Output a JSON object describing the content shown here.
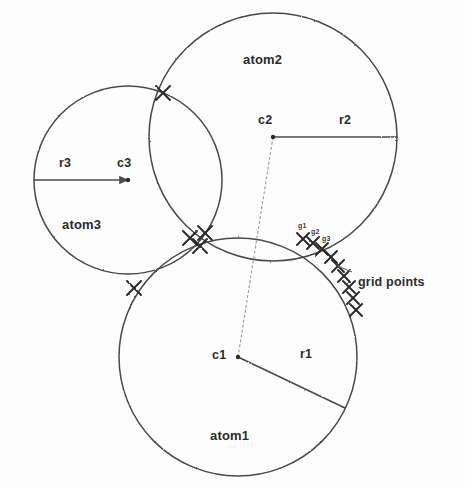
{
  "figure": {
    "background_color": "#fdfdfd",
    "stroke_color": "#4a4a4a",
    "mark_color": "#2b2b2b"
  },
  "atoms": [
    {
      "id": "atom1",
      "label": "atom1",
      "label_x": 210,
      "label_y": 428,
      "center_label": "c1",
      "center_label_x": 212,
      "center_label_y": 348,
      "radius_label": "r1",
      "radius_label_x": 300,
      "radius_label_y": 347,
      "cx": 238,
      "cy": 357,
      "r": 119,
      "radius_line": {
        "x1": 238,
        "y1": 357,
        "x2": 345,
        "y2": 408
      }
    },
    {
      "id": "atom2",
      "label": "atom2",
      "label_x": 243,
      "label_y": 52,
      "center_label": "c2",
      "center_label_x": 258,
      "center_label_y": 113,
      "radius_label": "r2",
      "radius_label_x": 339,
      "radius_label_y": 113,
      "cx": 273,
      "cy": 137,
      "r": 124,
      "radius_line": {
        "x1": 273,
        "y1": 137,
        "x2": 397,
        "y2": 137
      }
    },
    {
      "id": "atom3",
      "label": "atom3",
      "label_x": 62,
      "label_y": 217,
      "center_label": "c3",
      "center_label_x": 117,
      "center_label_y": 156,
      "radius_label": "r3",
      "radius_label_x": 59,
      "radius_label_y": 156,
      "cx": 128,
      "cy": 180,
      "r": 94,
      "radius_line": {
        "x1": 34,
        "y1": 180,
        "x2": 128,
        "y2": 180
      }
    }
  ],
  "connector": {
    "name": "c2-to-c1-line",
    "x1": 273,
    "y1": 137,
    "x2": 238,
    "y2": 357
  },
  "intersection_marks": [
    {
      "name": "atom2-atom3-upper",
      "x": 163,
      "y": 93,
      "size": 7
    },
    {
      "name": "triple-junction-left",
      "x": 190,
      "y": 238,
      "size": 7
    },
    {
      "name": "triple-junction-mid",
      "x": 205,
      "y": 233,
      "size": 7
    },
    {
      "name": "triple-junction-low",
      "x": 200,
      "y": 246,
      "size": 7
    },
    {
      "name": "atom3-atom1-lower",
      "x": 134,
      "y": 288,
      "size": 7
    }
  ],
  "grid_points": {
    "label": "grid points",
    "label_x": 358,
    "label_y": 275,
    "leader": {
      "x1": 352,
      "y1": 272,
      "x2": 338,
      "y2": 266
    },
    "marks": [
      {
        "name": "grid-point-1",
        "x": 303,
        "y": 239,
        "size": 6
      },
      {
        "name": "grid-point-2",
        "x": 313,
        "y": 243,
        "size": 6
      },
      {
        "name": "grid-point-3",
        "x": 322,
        "y": 249,
        "size": 6
      },
      {
        "name": "grid-point-4",
        "x": 331,
        "y": 257,
        "size": 6
      },
      {
        "name": "grid-point-5",
        "x": 338,
        "y": 266,
        "size": 6
      },
      {
        "name": "grid-point-6",
        "x": 344,
        "y": 276,
        "size": 6
      },
      {
        "name": "grid-point-7",
        "x": 349,
        "y": 287,
        "size": 6
      },
      {
        "name": "grid-point-8",
        "x": 353,
        "y": 298,
        "size": 6
      },
      {
        "name": "grid-point-9",
        "x": 356,
        "y": 310,
        "size": 6
      }
    ],
    "index_labels": [
      {
        "text": "g1",
        "x": 298,
        "y": 222
      },
      {
        "text": "g2",
        "x": 311,
        "y": 228
      },
      {
        "text": "g3",
        "x": 322,
        "y": 235
      }
    ]
  }
}
